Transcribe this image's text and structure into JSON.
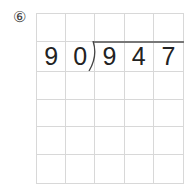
{
  "problem": {
    "label": "⑥",
    "divisor": [
      "9",
      "0"
    ],
    "dividend": [
      "9",
      "4",
      "7"
    ]
  },
  "grid": {
    "columns": 5,
    "rows": 6,
    "cells": [
      [
        "",
        "",
        "",
        "",
        ""
      ],
      [
        "9",
        "0",
        "9",
        "4",
        "7"
      ],
      [
        "",
        "",
        "",
        "",
        ""
      ],
      [
        "",
        "",
        "",
        "",
        ""
      ],
      [
        "",
        "",
        "",
        "",
        ""
      ],
      [
        "",
        "",
        "",
        "",
        ""
      ]
    ]
  }
}
